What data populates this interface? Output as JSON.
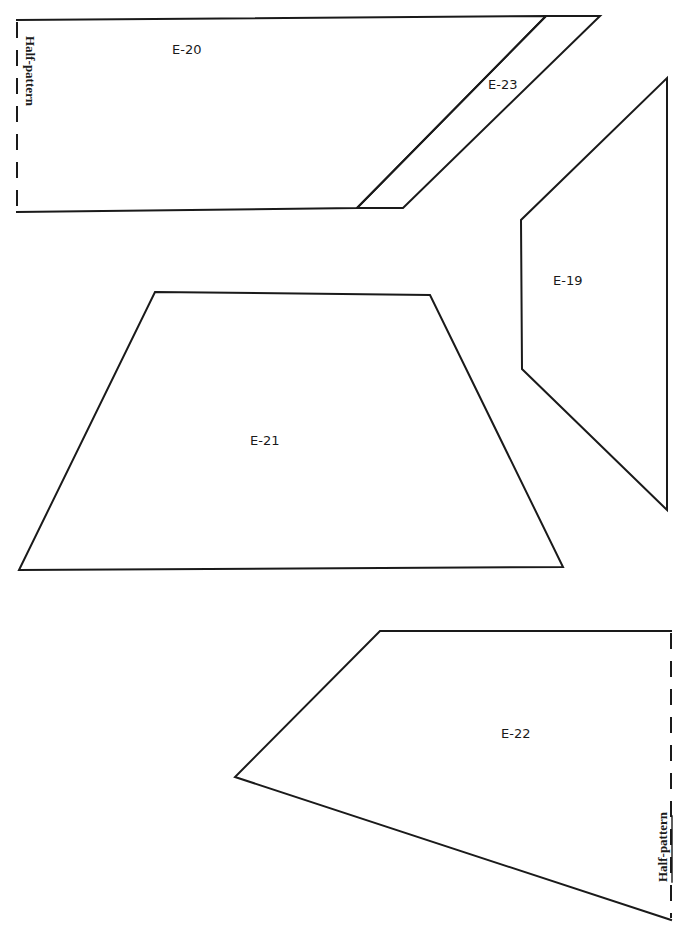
{
  "sheet": {
    "ink_color": "#1a1a1a",
    "background": "#ffffff"
  },
  "pieces": [
    {
      "id": "E-20",
      "label": "E-20",
      "fold_note": "Half-pattern"
    },
    {
      "id": "E-23",
      "label": "E-23"
    },
    {
      "id": "E-19",
      "label": "E-19"
    },
    {
      "id": "E-21",
      "label": "E-21"
    },
    {
      "id": "E-22",
      "label": "E-22",
      "fold_note": "Half-pattern"
    }
  ]
}
